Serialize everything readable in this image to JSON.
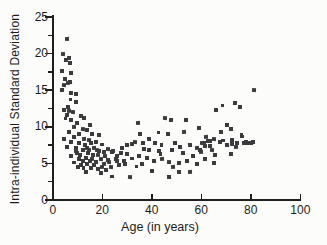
{
  "figure": {
    "background_color": "#fcfcfa",
    "axis_color": "#1f1f1f",
    "marker_color": "#3a3a3c",
    "marker_shape": "square"
  },
  "chart_data": {
    "type": "scatter",
    "title": "",
    "xlabel": "Age (in years)",
    "ylabel": "Intra-individual Standard Deviation",
    "xlim": [
      0,
      100
    ],
    "ylim": [
      0,
      25
    ],
    "x_ticks": [
      0,
      20,
      40,
      60,
      80,
      100
    ],
    "y_ticks": [
      0,
      5,
      10,
      15,
      20,
      25
    ],
    "y_minor_ticks": [
      2.5,
      7.5,
      12.5,
      17.5,
      22.5
    ],
    "grid": false,
    "legend": null,
    "points": [
      [
        5.5,
        22.0
      ],
      [
        4.2,
        20.0
      ],
      [
        6.3,
        19.5
      ],
      [
        5.4,
        19.1
      ],
      [
        6.9,
        18.8
      ],
      [
        3.8,
        17.6
      ],
      [
        7.4,
        17.4
      ],
      [
        4.7,
        16.5
      ],
      [
        7.0,
        16.2
      ],
      [
        6.1,
        16.0
      ],
      [
        4.6,
        15.7
      ],
      [
        3.8,
        15.1
      ],
      [
        7.1,
        14.7
      ],
      [
        9.2,
        14.5
      ],
      [
        7.1,
        13.7
      ],
      [
        9.2,
        13.4
      ],
      [
        6.1,
        12.8
      ],
      [
        4.4,
        12.3
      ],
      [
        6.5,
        12.2
      ],
      [
        8.2,
        12.1
      ],
      [
        5.5,
        11.6
      ],
      [
        11.2,
        11.5
      ],
      [
        12.5,
        11.2
      ],
      [
        5.1,
        11.1
      ],
      [
        7.1,
        10.9
      ],
      [
        9.8,
        10.5
      ],
      [
        14.9,
        10.3
      ],
      [
        8.5,
        10.0
      ],
      [
        11.9,
        9.8
      ],
      [
        13.9,
        9.6
      ],
      [
        6.5,
        9.3
      ],
      [
        10.5,
        9.1
      ],
      [
        15.9,
        9.0
      ],
      [
        18.6,
        8.9
      ],
      [
        8.5,
        8.7
      ],
      [
        4.4,
        8.4
      ],
      [
        12.5,
        8.4
      ],
      [
        14.5,
        8.2
      ],
      [
        17.2,
        8.0
      ],
      [
        7.1,
        8.0
      ],
      [
        10.5,
        7.8
      ],
      [
        19.9,
        7.6
      ],
      [
        5.8,
        7.3
      ],
      [
        9.2,
        7.2
      ],
      [
        13.9,
        7.2
      ],
      [
        16.6,
        7.1
      ],
      [
        22.0,
        7.0
      ],
      [
        11.9,
        6.8
      ],
      [
        18.6,
        6.7
      ],
      [
        24.0,
        6.6
      ],
      [
        28.0,
        7.1
      ],
      [
        30.0,
        7.5
      ],
      [
        9.4,
        6.7
      ],
      [
        12.2,
        6.8
      ],
      [
        14.5,
        6.9
      ],
      [
        17.9,
        6.8
      ],
      [
        20.6,
        6.6
      ],
      [
        24.2,
        6.7
      ],
      [
        27.3,
        6.4
      ],
      [
        30.0,
        6.3
      ],
      [
        7.1,
        6.0
      ],
      [
        10.5,
        5.7
      ],
      [
        13.2,
        5.8
      ],
      [
        15.9,
        5.7
      ],
      [
        19.3,
        5.7
      ],
      [
        22.0,
        5.5
      ],
      [
        25.3,
        5.7
      ],
      [
        28.7,
        5.4
      ],
      [
        8.5,
        5.1
      ],
      [
        11.2,
        4.8
      ],
      [
        13.9,
        4.9
      ],
      [
        16.6,
        4.8
      ],
      [
        19.9,
        4.6
      ],
      [
        23.3,
        4.5
      ],
      [
        26.6,
        4.8
      ],
      [
        13.2,
        3.9
      ],
      [
        19.3,
        3.7
      ],
      [
        24.0,
        3.2
      ],
      [
        12.8,
        7.5
      ],
      [
        15.2,
        7.8
      ],
      [
        16.2,
        6.2
      ],
      [
        18.0,
        6.2
      ],
      [
        21.0,
        6.1
      ],
      [
        25.8,
        6.1
      ],
      [
        9.8,
        6.4
      ],
      [
        11.0,
        6.2
      ],
      [
        14.2,
        6.4
      ],
      [
        12.0,
        5.3
      ],
      [
        14.8,
        5.4
      ],
      [
        17.5,
        5.2
      ],
      [
        20.5,
        5.0
      ],
      [
        22.8,
        5.2
      ],
      [
        26.0,
        5.3
      ],
      [
        29.0,
        4.9
      ],
      [
        10.2,
        4.6
      ],
      [
        12.5,
        4.4
      ],
      [
        15.5,
        4.4
      ],
      [
        18.2,
        4.3
      ],
      [
        21.5,
        4.2
      ],
      [
        34.3,
        10.6
      ],
      [
        45.1,
        11.2
      ],
      [
        47.5,
        10.9
      ],
      [
        53.8,
        10.9
      ],
      [
        59.1,
        9.9
      ],
      [
        42.7,
        9.2
      ],
      [
        35.3,
        9.1
      ],
      [
        38.6,
        8.3
      ],
      [
        46.4,
        9.1
      ],
      [
        52.8,
        9.3
      ],
      [
        33.0,
        8.0
      ],
      [
        31.9,
        7.7
      ],
      [
        36.2,
        7.8
      ],
      [
        41.1,
        7.8
      ],
      [
        44.0,
        7.5
      ],
      [
        49.4,
        7.8
      ],
      [
        51.4,
        7.3
      ],
      [
        55.5,
        7.5
      ],
      [
        58.1,
        7.2
      ],
      [
        61.2,
        7.4
      ],
      [
        38.6,
        6.8
      ],
      [
        42.7,
        6.7
      ],
      [
        48.0,
        6.9
      ],
      [
        31.9,
        5.7
      ],
      [
        34.6,
        6.1
      ],
      [
        38.0,
        5.8
      ],
      [
        40.7,
        5.3
      ],
      [
        44.0,
        5.7
      ],
      [
        46.7,
        5.2
      ],
      [
        50.7,
        5.1
      ],
      [
        54.1,
        5.4
      ],
      [
        58.1,
        4.9
      ],
      [
        33.9,
        4.6
      ],
      [
        40.0,
        4.0
      ],
      [
        46.7,
        3.2
      ],
      [
        50.7,
        3.9
      ],
      [
        55.5,
        3.8
      ],
      [
        31.2,
        3.2
      ],
      [
        59.5,
        6.8
      ],
      [
        61.5,
        5.7
      ],
      [
        36.8,
        7.0
      ],
      [
        43.5,
        6.3
      ],
      [
        52.5,
        6.4
      ],
      [
        56.5,
        6.1
      ],
      [
        35.8,
        4.9
      ],
      [
        48.5,
        4.5
      ],
      [
        81.0,
        15.1
      ],
      [
        73.5,
        13.3
      ],
      [
        75.5,
        12.8
      ],
      [
        66.0,
        12.3
      ],
      [
        68.5,
        12.9
      ],
      [
        70.1,
        10.3
      ],
      [
        71.7,
        9.7
      ],
      [
        67.7,
        9.3
      ],
      [
        62.0,
        8.7
      ],
      [
        65.0,
        8.4
      ],
      [
        61.0,
        7.8
      ],
      [
        63.4,
        8.1
      ],
      [
        72.4,
        8.2
      ],
      [
        76.5,
        8.7
      ],
      [
        77.8,
        8.0
      ],
      [
        79.8,
        7.8
      ],
      [
        70.4,
        7.5
      ],
      [
        73.8,
        7.3
      ],
      [
        60.3,
        7.8
      ],
      [
        62.6,
        8.1
      ],
      [
        63.4,
        7.4
      ],
      [
        67.4,
        8.0
      ],
      [
        68.8,
        8.1
      ],
      [
        72.4,
        7.7
      ],
      [
        74.4,
        7.8
      ],
      [
        77.1,
        7.8
      ],
      [
        59.6,
        6.6
      ],
      [
        64.3,
        6.8
      ],
      [
        65.3,
        6.2
      ],
      [
        71.7,
        6.3
      ],
      [
        65.0,
        5.1
      ],
      [
        76.2,
        8.9
      ],
      [
        78.2,
        7.8
      ],
      [
        80.9,
        8.0
      ]
    ]
  }
}
